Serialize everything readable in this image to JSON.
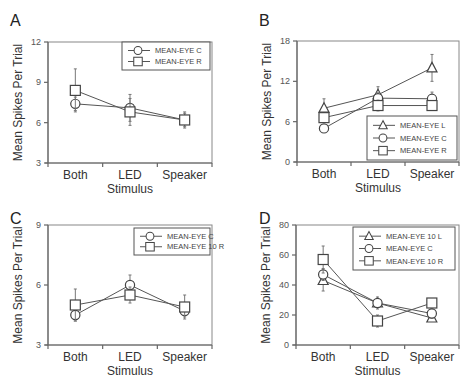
{
  "figure": {
    "panels_count": 4
  },
  "chart_data": [
    {
      "panel": "A",
      "type": "line",
      "title": "A",
      "xlabel": "Stimulus",
      "ylabel": "Mean Spikes Per Trial",
      "categories": [
        "Both",
        "LED",
        "Speaker"
      ],
      "ylim": [
        3,
        12
      ],
      "yticks": [
        3,
        6,
        9,
        12
      ],
      "grid": false,
      "legend_position": "upper right",
      "series": [
        {
          "name": "MEAN-EYE C",
          "marker": "circle",
          "values": [
            7.4,
            7.1,
            6.2
          ],
          "err": [
            0.5,
            1.0,
            0.5
          ]
        },
        {
          "name": "MEAN-EYE R",
          "marker": "square",
          "values": [
            8.4,
            6.8,
            6.2
          ],
          "err": [
            1.6,
            1.0,
            0.6
          ]
        }
      ]
    },
    {
      "panel": "B",
      "type": "line",
      "title": "B",
      "xlabel": "Stimulus",
      "ylabel": "Mean Spikes Per Trial",
      "categories": [
        "Both",
        "LED",
        "Speaker"
      ],
      "ylim": [
        0,
        18
      ],
      "yticks": [
        0,
        6,
        12,
        18
      ],
      "grid": false,
      "legend_position": "lower right",
      "series": [
        {
          "name": "MEAN-EYE L",
          "marker": "triangle",
          "values": [
            8.0,
            10.0,
            14.0
          ],
          "err": [
            1.4,
            1.2,
            2.0
          ]
        },
        {
          "name": "MEAN-EYE C",
          "marker": "circle",
          "values": [
            5.0,
            9.5,
            9.4
          ],
          "err": [
            0.4,
            0.8,
            1.0
          ]
        },
        {
          "name": "MEAN-EYE R",
          "marker": "square",
          "values": [
            6.6,
            8.4,
            8.4
          ],
          "err": [
            0.6,
            0.8,
            0.6
          ]
        }
      ]
    },
    {
      "panel": "C",
      "type": "line",
      "title": "C",
      "xlabel": "Stimulus",
      "ylabel": "Mean Spikes Per Trial",
      "categories": [
        "Both",
        "LED",
        "Speaker"
      ],
      "ylim": [
        3,
        9
      ],
      "yticks": [
        3,
        6,
        9
      ],
      "grid": false,
      "legend_position": "upper right",
      "series": [
        {
          "name": "MEAN-EYE C",
          "marker": "circle",
          "values": [
            4.5,
            6.0,
            4.7
          ],
          "err": [
            0.3,
            0.5,
            0.3
          ]
        },
        {
          "name": "MEAN-EYE 10 R",
          "marker": "square",
          "values": [
            5.0,
            5.5,
            4.9
          ],
          "err": [
            0.8,
            0.4,
            0.6
          ]
        }
      ]
    },
    {
      "panel": "D",
      "type": "line",
      "title": "D",
      "xlabel": "Stimulus",
      "ylabel": "Mean Spikes Per Trial",
      "categories": [
        "Both",
        "LED",
        "Speaker"
      ],
      "ylim": [
        0,
        80
      ],
      "yticks": [
        0,
        20,
        40,
        60,
        80
      ],
      "grid": false,
      "legend_position": "upper right",
      "series": [
        {
          "name": "MEAN-EYE 10 L",
          "marker": "triangle",
          "values": [
            43,
            28,
            18
          ],
          "err": [
            7,
            3,
            2
          ]
        },
        {
          "name": "MEAN-EYE C",
          "marker": "circle",
          "values": [
            47,
            28,
            21
          ],
          "err": [
            4,
            4,
            3
          ]
        },
        {
          "name": "MEAN-EYE 10 R",
          "marker": "square",
          "values": [
            57,
            16,
            28
          ],
          "err": [
            9,
            4,
            3
          ]
        }
      ]
    }
  ],
  "layout": {
    "panels": [
      {
        "x0": 48,
        "x1": 212,
        "yTop": 42,
        "yBot": 163,
        "letterX": 10,
        "letterY": 20,
        "legend": {
          "x": 122,
          "y": 42,
          "w": 88,
          "h": 28
        }
      },
      {
        "x0": 297,
        "x1": 459,
        "yTop": 41,
        "yBot": 162,
        "letterX": 259,
        "letterY": 20,
        "legend": {
          "x": 367,
          "y": 116,
          "w": 90,
          "h": 44
        }
      },
      {
        "x0": 48,
        "x1": 212,
        "yTop": 225,
        "yBot": 345,
        "letterX": 10,
        "letterY": 218,
        "legend": {
          "x": 134,
          "y": 228,
          "w": 76,
          "h": 27
        }
      },
      {
        "x0": 296,
        "x1": 459,
        "yTop": 225,
        "yBot": 345,
        "letterX": 259,
        "letterY": 218,
        "legend": {
          "x": 353,
          "y": 227,
          "w": 102,
          "h": 43
        }
      }
    ]
  }
}
